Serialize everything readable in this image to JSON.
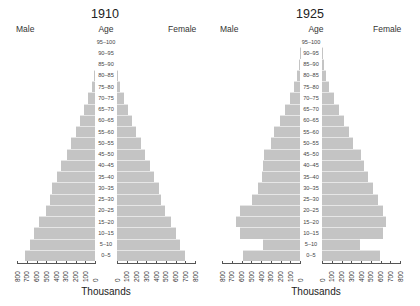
{
  "age_groups": [
    "0–5",
    "5–10",
    "10–15",
    "15–20",
    "20–25",
    "25–30",
    "30–35",
    "35–40",
    "40–45",
    "45–50",
    "50–55",
    "55–60",
    "60–65",
    "65–70",
    "70–75",
    "75–80",
    "80–85",
    "85–90",
    "90–95",
    "95–100"
  ],
  "labels": {
    "male": "Male",
    "female": "Female",
    "age": "Age",
    "xlabel": "Thousands"
  },
  "ticks": [
    0,
    100,
    200,
    300,
    400,
    500,
    600,
    700,
    800
  ],
  "colors": {
    "bar": "#c4c4c4",
    "axis": "#555555",
    "text": "#222222"
  },
  "chart_data": [
    {
      "type": "bar",
      "orientation": "population-pyramid",
      "title": "1910",
      "xlabel": "Thousands",
      "ylabel": "Age",
      "xlim": [
        0,
        800
      ],
      "categories": [
        "0–5",
        "5–10",
        "10–15",
        "15–20",
        "20–25",
        "25–30",
        "30–35",
        "35–40",
        "40–45",
        "45–50",
        "50–55",
        "55–60",
        "60–65",
        "65–70",
        "70–75",
        "75–80",
        "80–85",
        "85–90",
        "90–95",
        "95–100"
      ],
      "series": [
        {
          "name": "Male",
          "values": [
            720,
            670,
            625,
            575,
            500,
            460,
            440,
            390,
            350,
            290,
            245,
            195,
            155,
            115,
            70,
            30,
            10,
            0,
            0,
            0
          ]
        },
        {
          "name": "Female",
          "values": [
            700,
            650,
            605,
            555,
            490,
            450,
            430,
            380,
            340,
            285,
            245,
            195,
            155,
            115,
            70,
            30,
            10,
            0,
            0,
            0
          ]
        }
      ]
    },
    {
      "type": "bar",
      "orientation": "population-pyramid",
      "title": "1925",
      "xlabel": "Thousands",
      "ylabel": "Age",
      "xlim": [
        0,
        800
      ],
      "categories": [
        "0–5",
        "5–10",
        "10–15",
        "15–20",
        "20–25",
        "25–30",
        "30–35",
        "35–40",
        "40–45",
        "45–50",
        "50–55",
        "55–60",
        "60–65",
        "65–70",
        "70–75",
        "75–80",
        "80–85",
        "85–90",
        "90–95",
        "95–100"
      ],
      "series": [
        {
          "name": "Male",
          "values": [
            585,
            380,
            615,
            655,
            615,
            490,
            430,
            390,
            380,
            370,
            300,
            265,
            205,
            155,
            100,
            60,
            30,
            10,
            3,
            0
          ]
        },
        {
          "name": "Female",
          "values": [
            595,
            390,
            625,
            655,
            625,
            575,
            525,
            470,
            430,
            400,
            320,
            275,
            225,
            175,
            125,
            70,
            40,
            20,
            5,
            0
          ]
        }
      ]
    }
  ]
}
